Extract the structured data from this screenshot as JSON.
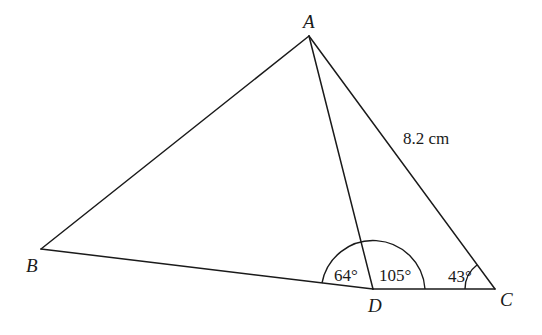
{
  "diagram": {
    "type": "triangle-geometry",
    "vertices": {
      "A": {
        "label": "A",
        "x": 309,
        "y": 36
      },
      "B": {
        "label": "B",
        "x": 41,
        "y": 249
      },
      "C": {
        "label": "C",
        "x": 495,
        "y": 289
      },
      "D": {
        "label": "D",
        "x": 373,
        "y": 289
      }
    },
    "segments": [
      "AB",
      "AC",
      "BD",
      "DC",
      "AD"
    ],
    "angles": [
      {
        "at": "D",
        "between": "BD-AD",
        "label": "64°"
      },
      {
        "at": "D",
        "between": "AD-DC",
        "label": "105°"
      },
      {
        "at": "C",
        "between": "DC-CA",
        "label": "43°"
      }
    ],
    "side_labels": [
      {
        "side": "AC",
        "label": "8.2 cm"
      }
    ],
    "colors": {
      "stroke": "#1a1a1a",
      "background": "#ffffff"
    }
  }
}
